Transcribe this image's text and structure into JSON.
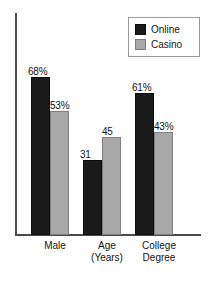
{
  "chart_data": {
    "type": "bar",
    "title": "",
    "subtitle": "",
    "xlabel": "",
    "ylabel": "",
    "ylim": [
      0,
      80
    ],
    "grid": false,
    "legend_position": "top-right",
    "categories": [
      "Male",
      "Age (Years)",
      "College Degree"
    ],
    "series": [
      {
        "name": "Online",
        "color": "#1a1a1a",
        "values": [
          68,
          31,
          61
        ],
        "labels": [
          "68%",
          "31",
          "61%"
        ]
      },
      {
        "name": "Casino",
        "color": "#a8a8a8",
        "values": [
          53,
          45,
          43
        ],
        "labels": [
          "53%",
          "45",
          "43%"
        ]
      }
    ],
    "annotations": [
      "Male: Online 68%, Casino 53%",
      "Age (Years): Online 31, Casino 45",
      "College Degree: Online 61%, Casino 43%"
    ]
  },
  "legend": {
    "items": [
      {
        "label": "Online",
        "swatch": "legend-swatch-online"
      },
      {
        "label": "Casino",
        "swatch": "legend-swatch-casino"
      }
    ]
  },
  "xaxis": {
    "ticks": [
      {
        "line1": "Male",
        "line2": ""
      },
      {
        "line1": "Age",
        "line2": "(Years)"
      },
      {
        "line1": "College",
        "line2": "Degree"
      }
    ]
  },
  "bars": {
    "male_online": {
      "label": "68%",
      "height_pct": 70.5
    },
    "male_casino": {
      "label": "53%",
      "height_pct": 55.0
    },
    "age_online": {
      "label": "31",
      "height_pct": 32.9
    },
    "age_casino": {
      "label": "45",
      "height_pct": 43.2
    },
    "degree_online": {
      "label": "61%",
      "height_pct": 63.1
    },
    "degree_casino": {
      "label": "43%",
      "height_pct": 45.5
    }
  }
}
